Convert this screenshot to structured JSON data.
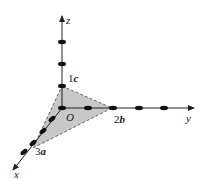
{
  "diagram": {
    "type": "3d-coordinate-axes-with-intercept-plane",
    "axes": {
      "x": {
        "label": "x"
      },
      "y": {
        "label": "y"
      },
      "z": {
        "label": "z"
      }
    },
    "origin_label": "O",
    "intercepts": {
      "x": {
        "coef": "3",
        "vec": "a"
      },
      "y": {
        "coef": "2",
        "vec": "b"
      },
      "z": {
        "coef": "1",
        "vec": "c"
      }
    },
    "colors": {
      "plane_fill": "#c8c8c8",
      "axis": "#222222",
      "point": "#111111"
    }
  }
}
